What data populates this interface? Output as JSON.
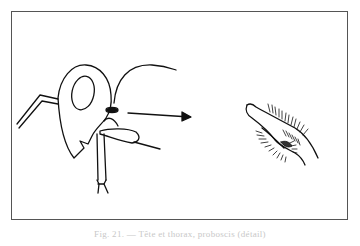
{
  "figure": {
    "caption": "Fig. 21. — Tête et thorax, proboscis (détail)",
    "panels": [
      {
        "name": "head-thorax-profile",
        "description": "insect head and thorax in lateral view with legs and antenna"
      },
      {
        "name": "proboscis-detail",
        "description": "enlarged hairy mouthpart"
      }
    ],
    "arrow": {
      "direction": "right",
      "from": "head-thorax-profile",
      "to": "proboscis-detail"
    },
    "line_color": "#111111",
    "frame_color": "#555555"
  }
}
